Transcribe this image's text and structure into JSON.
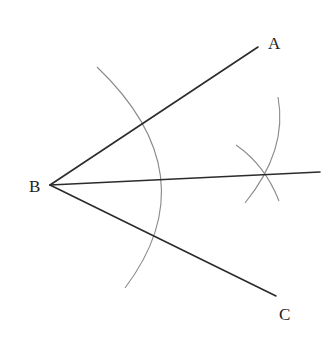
{
  "diagram": {
    "title": "",
    "type": "angle-bisector-construction",
    "points": {
      "A": {
        "label": "A",
        "x": 258,
        "y": 47
      },
      "B": {
        "label": "B",
        "x": 50,
        "y": 185
      },
      "C": {
        "label": "C",
        "x": 276,
        "y": 296
      },
      "bisector_end": {
        "x": 320,
        "y": 172
      }
    },
    "labels": {
      "A": "A",
      "B": "B",
      "C": "C"
    },
    "colors": {
      "ray": "#2b2b2b",
      "arc": "#8a8a8a",
      "background": "#ffffff"
    }
  }
}
